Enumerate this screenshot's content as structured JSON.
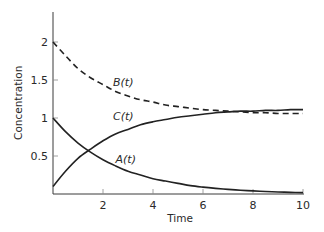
{
  "chart_data": {
    "type": "line",
    "title": "",
    "xlabel": "Time",
    "ylabel": "Concentration",
    "xlim": [
      0,
      10
    ],
    "ylim": [
      0,
      2.4
    ],
    "grid": false,
    "legend": "inline curve labels",
    "x_ticks": [
      "2",
      "4",
      "6",
      "8",
      "10"
    ],
    "y_ticks": [
      "0.5",
      "1",
      "1.5",
      "2"
    ],
    "x": [
      0,
      0.5,
      1,
      1.5,
      2,
      2.5,
      3,
      3.5,
      4,
      4.5,
      5,
      5.5,
      6,
      6.5,
      7,
      7.5,
      8,
      8.5,
      9,
      9.5,
      10
    ],
    "series": [
      {
        "name": "A(t)",
        "style": "solid",
        "values": [
          1.0,
          0.82,
          0.67,
          0.55,
          0.45,
          0.37,
          0.3,
          0.25,
          0.2,
          0.17,
          0.14,
          0.11,
          0.09,
          0.074,
          0.061,
          0.05,
          0.041,
          0.033,
          0.027,
          0.022,
          0.018
        ]
      },
      {
        "name": "B(t)",
        "style": "dashed",
        "values": [
          2.0,
          1.82,
          1.65,
          1.53,
          1.44,
          1.35,
          1.29,
          1.24,
          1.21,
          1.17,
          1.15,
          1.13,
          1.11,
          1.1,
          1.09,
          1.08,
          1.07,
          1.07,
          1.06,
          1.06,
          1.06
        ]
      },
      {
        "name": "C(t)",
        "style": "solid",
        "values": [
          0.1,
          0.3,
          0.47,
          0.59,
          0.7,
          0.79,
          0.85,
          0.91,
          0.95,
          0.98,
          1.01,
          1.03,
          1.05,
          1.07,
          1.08,
          1.09,
          1.09,
          1.1,
          1.1,
          1.11,
          1.11
        ]
      }
    ],
    "annotations": [
      {
        "text": "B(t)",
        "x": 2.4,
        "y": 1.42
      },
      {
        "text": "C(t)",
        "x": 2.4,
        "y": 0.97
      },
      {
        "text": "A(t)",
        "x": 2.5,
        "y": 0.41
      }
    ]
  }
}
